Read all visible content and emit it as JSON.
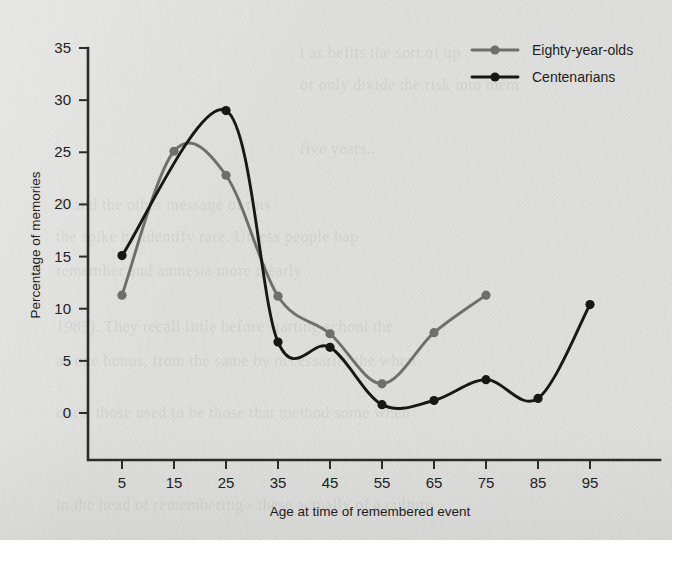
{
  "chart_data": {
    "type": "line",
    "title": "",
    "xlabel": "Age at time of remembered event",
    "ylabel": "Percentage of memories",
    "x": [
      5,
      15,
      25,
      35,
      45,
      55,
      65,
      75,
      85,
      95
    ],
    "xticklabels": [
      "5",
      "15",
      "25",
      "35",
      "45",
      "55",
      "65",
      "75",
      "85",
      "95"
    ],
    "yticklabels": [
      "0",
      "5",
      "10",
      "15",
      "20",
      "25",
      "30",
      "35"
    ],
    "yticks": [
      0,
      5,
      10,
      15,
      20,
      25,
      30,
      35
    ],
    "ylim": [
      0,
      35
    ],
    "xlim": [
      0,
      100
    ],
    "grid": false,
    "legend_position": "top-right",
    "smoothing": "spline",
    "series": [
      {
        "name": "Eighty-year-olds",
        "color": "#6e6e6e",
        "marker": "circle",
        "x": [
          5,
          15,
          25,
          35,
          45,
          55,
          65,
          75
        ],
        "values": [
          11.3,
          25.1,
          22.8,
          11.2,
          7.6,
          2.8,
          7.7,
          11.3
        ]
      },
      {
        "name": "Centenarians",
        "color": "#171717",
        "marker": "circle",
        "x": [
          5,
          25,
          35,
          45,
          55,
          65,
          75,
          85,
          95
        ],
        "values": [
          15.1,
          29.0,
          6.8,
          6.3,
          0.8,
          1.2,
          3.2,
          1.4,
          10.4
        ]
      }
    ]
  },
  "legend": {
    "items": [
      {
        "label": "Eighty-year-olds",
        "color": "#6e6e6e"
      },
      {
        "label": "Centenarians",
        "color": "#171717"
      }
    ]
  },
  "axes": {
    "y_title": "Percentage of memories",
    "x_title": "Age at time of remembered event"
  },
  "ghost_text": {
    "lines": [
      "t as befits the sort of up",
      "or only divide the risk into mem",
      "five years..",
      "d, and the other message of this",
      "the spike he identify rare. Unless people hap",
      "remember and amnesia more clearly",
      "1985). They recall little before starting school the",
      "as one bonus, from the same by necessarily the when",
      "ones, those used to be those that method some when",
      "in the head of remembering - these actually of a culture"
    ]
  }
}
